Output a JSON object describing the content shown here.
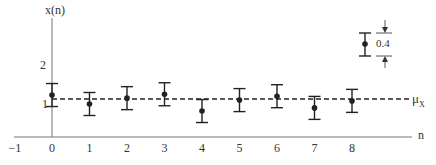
{
  "chart_data": {
    "type": "scatter",
    "title": "",
    "xlabel": "n",
    "ylabel": "x(n)",
    "x_ticks": [
      "-1",
      "0",
      "1",
      "2",
      "3",
      "4",
      "5",
      "6",
      "7",
      "8"
    ],
    "y_ticks": [
      "1",
      "2"
    ],
    "series": [
      {
        "name": "x(n) with error bars",
        "x": [
          0,
          1,
          2,
          3,
          4,
          5,
          6,
          7,
          8
        ],
        "y": [
          1.23,
          1.0,
          1.15,
          1.25,
          0.82,
          1.1,
          1.2,
          0.9,
          1.08
        ],
        "error_bar_length": 0.4
      }
    ],
    "reference_line": {
      "label": "μX",
      "value": 1.13,
      "style": "dashed"
    },
    "annotation": {
      "text": "0.4",
      "description": "error bar total length"
    },
    "grid": false
  },
  "labels": {
    "y_axis": "x(n)",
    "x_axis": "n",
    "mu": "μ",
    "mu_sub": "X",
    "scale": "0.4",
    "xt": [
      "−1",
      "0",
      "1",
      "2",
      "3",
      "4",
      "5",
      "6",
      "7",
      "8"
    ],
    "yt": [
      "2",
      "1"
    ]
  }
}
